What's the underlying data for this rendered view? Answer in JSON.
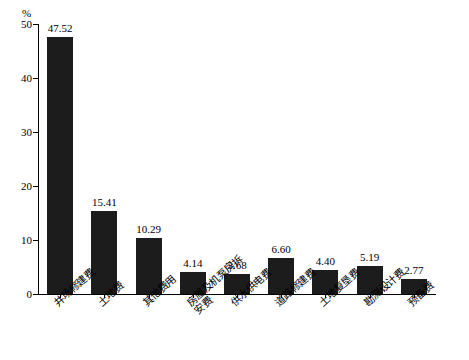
{
  "chart_data": {
    "type": "bar",
    "title": "",
    "subtitle": "",
    "xlabel": "",
    "ylabel": "%",
    "unit_label": "%",
    "ylim": [
      0,
      50
    ],
    "yticks": [
      0,
      10,
      20,
      30,
      40,
      50
    ],
    "ytick_labels": [
      "0",
      "10",
      "20",
      "30",
      "40",
      "50"
    ],
    "grid": false,
    "legend": "none",
    "bar_color": "#1c1c1c",
    "categories": [
      "井场修建费",
      "土地费",
      "其他费用",
      "房屋及机泵房拆安费",
      "供水供电费",
      "道路修建费",
      "土地复垦费",
      "勘测设计费",
      "预备费"
    ],
    "values": [
      47.52,
      15.41,
      10.29,
      4.14,
      3.68,
      6.6,
      4.4,
      5.19,
      2.77
    ],
    "value_labels": [
      "47.52",
      "15.41",
      "10.29",
      "4.14",
      "3.68",
      "6.60",
      "4.40",
      "5.19",
      "2.77"
    ]
  }
}
